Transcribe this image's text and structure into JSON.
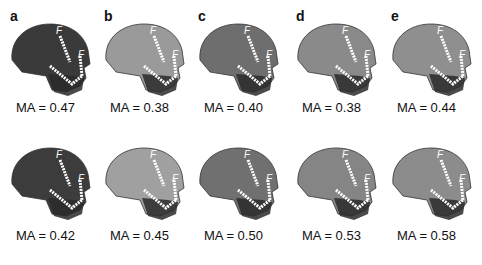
{
  "figure": {
    "panels": [
      {
        "letter": "a",
        "top_ma": "MA = 0.47",
        "bottom_ma": "MA = 0.42",
        "tone_top": "#3a3a3a",
        "tone_bottom": "#3c3c3c"
      },
      {
        "letter": "b",
        "top_ma": "MA = 0.38",
        "bottom_ma": "MA = 0.45",
        "tone_top": "#9a9a9a",
        "tone_bottom": "#a0a0a0"
      },
      {
        "letter": "c",
        "top_ma": "MA = 0.40",
        "bottom_ma": "MA = 0.50",
        "tone_top": "#6e6e6e",
        "tone_bottom": "#707070"
      },
      {
        "letter": "d",
        "top_ma": "MA = 0.38",
        "bottom_ma": "MA = 0.53",
        "tone_top": "#8a8a8a",
        "tone_bottom": "#858585"
      },
      {
        "letter": "e",
        "top_ma": "MA = 0.44",
        "bottom_ma": "MA = 0.58",
        "tone_top": "#8f8f8f",
        "tone_bottom": "#8c8c8c"
      }
    ],
    "vector_labels": [
      "F",
      "F"
    ]
  }
}
